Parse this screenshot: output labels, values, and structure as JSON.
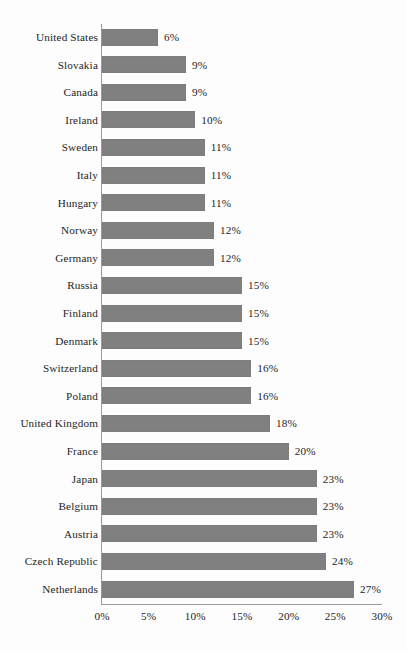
{
  "chart_data": {
    "type": "bar",
    "orientation": "horizontal",
    "title": "",
    "subtitle": "",
    "xlabel": "",
    "ylabel": "",
    "xlim": [
      0,
      30
    ],
    "grid": false,
    "legend": null,
    "value_suffix": "%",
    "xticks": [
      "0%",
      "5%",
      "10%",
      "15%",
      "20%",
      "25%",
      "30%"
    ],
    "xtick_values": [
      0,
      5,
      10,
      15,
      20,
      25,
      30
    ],
    "bar_color": "#808080",
    "axis_color": "#9a9a9a",
    "text_color": "#242424",
    "background_color": "#fdfdfd",
    "categories": [
      "United States",
      "Slovakia",
      "Canada",
      "Ireland",
      "Sweden",
      "Italy",
      "Hungary",
      "Norway",
      "Germany",
      "Russia",
      "Finland",
      "Denmark",
      "Switzerland",
      "Poland",
      "United Kingdom",
      "France",
      "Japan",
      "Belgium",
      "Austria",
      "Czech Republic",
      "Netherlands"
    ],
    "values": [
      6,
      9,
      9,
      10,
      11,
      11,
      11,
      12,
      12,
      15,
      15,
      15,
      16,
      16,
      18,
      20,
      23,
      23,
      23,
      24,
      27
    ],
    "data_labels": [
      "6%",
      "9%",
      "9%",
      "10%",
      "11%",
      "11%",
      "11%",
      "12%",
      "12%",
      "15%",
      "15%",
      "15%",
      "16%",
      "16%",
      "18%",
      "20%",
      "23%",
      "23%",
      "23%",
      "24%",
      "27%"
    ]
  }
}
